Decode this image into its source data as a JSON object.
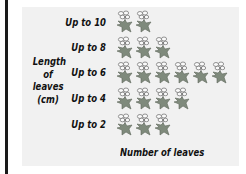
{
  "chart_data": {
    "type": "pictogram",
    "categories": [
      "Up to 10",
      "Up to 8",
      "Up to 6",
      "Up to 4",
      "Up to 2"
    ],
    "values": [
      2,
      3,
      6,
      4,
      3
    ],
    "ylabel": "Length of leaves (cm)",
    "xlabel": "Number of leaves",
    "icon": "leaf-icon",
    "colors": {
      "leaf": "#7f8a7c",
      "panel": "#f1f1f1"
    }
  },
  "labels": {
    "ylabel_lines": [
      "Length",
      "of",
      "leaves",
      "(cm)"
    ],
    "xlabel": "Number of leaves",
    "rows": [
      "Up to 10",
      "Up to 8",
      "Up to 6",
      "Up to 4",
      "Up to 2"
    ]
  }
}
